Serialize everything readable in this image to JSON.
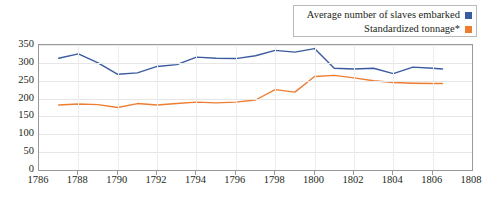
{
  "legend": {
    "position": "top-right",
    "entries": [
      {
        "label": "Average number of slaves embarked",
        "color": "#3a5ba0",
        "marker": "square"
      },
      {
        "label": "Standardized tonnage*",
        "color": "#ed7d31",
        "marker": "square"
      }
    ]
  },
  "axes": {
    "y_ticks": [
      "0",
      "50",
      "100",
      "150",
      "200",
      "250",
      "300",
      "350"
    ],
    "x_ticks": [
      "1786",
      "1788",
      "1790",
      "1792",
      "1794",
      "1796",
      "1798",
      "1800",
      "1802",
      "1804",
      "1806",
      "1808"
    ]
  },
  "chart_data": {
    "type": "line",
    "title": "",
    "xlabel": "",
    "ylabel": "",
    "xlim": [
      1786,
      1808
    ],
    "ylim": [
      0,
      350
    ],
    "grid": true,
    "legend_position": "top-right",
    "x": [
      1787,
      1788,
      1789,
      1790,
      1791,
      1792,
      1793,
      1794,
      1795,
      1796,
      1797,
      1798,
      1799,
      1800,
      1801,
      1802,
      1803,
      1804,
      1805,
      1806,
      1806.5
    ],
    "series": [
      {
        "name": "Average number of slaves embarked",
        "color": "#3a5ba0",
        "values": [
          313,
          325,
          300,
          268,
          272,
          290,
          295,
          316,
          313,
          312,
          320,
          335,
          330,
          340,
          285,
          283,
          285,
          270,
          288,
          285,
          283
        ]
      },
      {
        "name": "Standardized tonnage*",
        "color": "#ed7d31",
        "values": [
          182,
          185,
          183,
          175,
          186,
          182,
          186,
          190,
          188,
          190,
          196,
          225,
          218,
          262,
          265,
          258,
          250,
          245,
          243,
          242,
          242
        ]
      }
    ]
  }
}
